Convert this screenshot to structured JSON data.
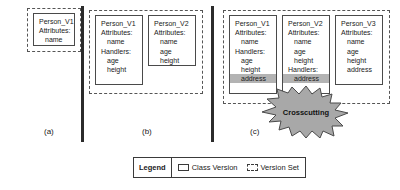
{
  "figure": {
    "caption_a": "(a)",
    "caption_b": "(b)",
    "caption_c": "(c)",
    "crosscutting_label": "Crosscutting"
  },
  "panel_a": {
    "version_set": {
      "boxes": [
        {
          "title": "Person_V1",
          "lines": [
            {
              "text": "Attributes:",
              "indent": false,
              "highlight": false
            },
            {
              "text": "name",
              "indent": true,
              "highlight": false
            }
          ]
        }
      ]
    }
  },
  "panel_b": {
    "version_set": {
      "boxes": [
        {
          "title": "Person_V1",
          "lines": [
            {
              "text": "Attributes:",
              "indent": false,
              "highlight": false
            },
            {
              "text": "name",
              "indent": true,
              "highlight": false
            },
            {
              "text": "Handlers:",
              "indent": false,
              "highlight": false
            },
            {
              "text": "age",
              "indent": true,
              "highlight": false
            },
            {
              "text": "height",
              "indent": true,
              "highlight": false
            }
          ]
        },
        {
          "title": "Person_V2",
          "lines": [
            {
              "text": "Attributes:",
              "indent": false,
              "highlight": false
            },
            {
              "text": "name",
              "indent": true,
              "highlight": false
            },
            {
              "text": "age",
              "indent": true,
              "highlight": false
            },
            {
              "text": "height",
              "indent": true,
              "highlight": false
            }
          ]
        }
      ]
    }
  },
  "panel_c": {
    "version_set": {
      "boxes": [
        {
          "title": "Person_V1",
          "lines": [
            {
              "text": "Attributes:",
              "indent": false,
              "highlight": false
            },
            {
              "text": "name",
              "indent": true,
              "highlight": false
            },
            {
              "text": "Handlers:",
              "indent": false,
              "highlight": false
            },
            {
              "text": "age",
              "indent": true,
              "highlight": false
            },
            {
              "text": "height",
              "indent": true,
              "highlight": false
            },
            {
              "text": "address",
              "indent": true,
              "highlight": true
            }
          ]
        },
        {
          "title": "Person_V2",
          "lines": [
            {
              "text": "Attributes:",
              "indent": false,
              "highlight": false
            },
            {
              "text": "name",
              "indent": true,
              "highlight": false
            },
            {
              "text": "age",
              "indent": true,
              "highlight": false
            },
            {
              "text": "height",
              "indent": true,
              "highlight": false
            },
            {
              "text": "Handlers:",
              "indent": false,
              "highlight": false
            },
            {
              "text": "address",
              "indent": true,
              "highlight": true
            }
          ]
        },
        {
          "title": "Person_V3",
          "lines": [
            {
              "text": "Attributes:",
              "indent": false,
              "highlight": false
            },
            {
              "text": "name",
              "indent": true,
              "highlight": false
            },
            {
              "text": "age",
              "indent": true,
              "highlight": false
            },
            {
              "text": "height",
              "indent": true,
              "highlight": false
            },
            {
              "text": "address",
              "indent": true,
              "highlight": false
            }
          ]
        }
      ]
    }
  },
  "legend": {
    "title": "Legend",
    "items": [
      {
        "label": "Class Version",
        "style": "solid"
      },
      {
        "label": "Version Set",
        "style": "dashed"
      }
    ]
  },
  "colors": {
    "highlight": "#b3b3b3",
    "starburst_fill": "#a8a8a8",
    "stroke": "#4a4a4a",
    "divider": "#2b2b2b"
  }
}
